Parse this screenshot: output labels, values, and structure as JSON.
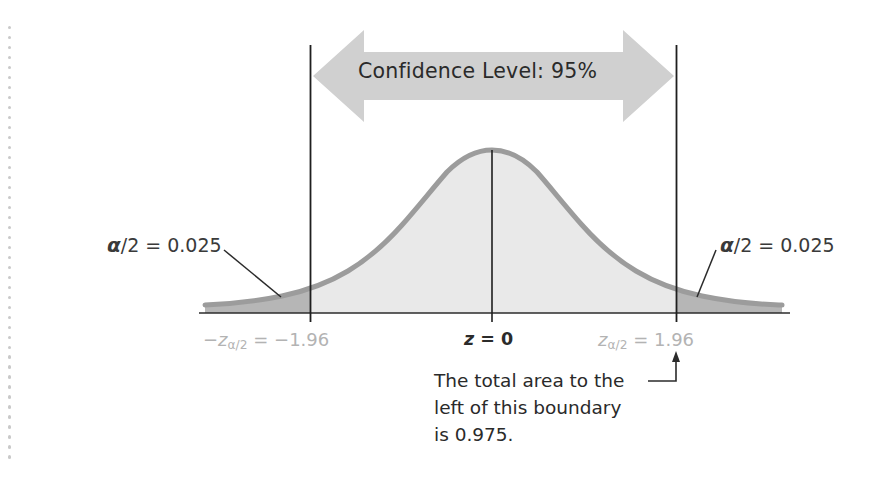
{
  "figure": {
    "background_color": "#ffffff"
  },
  "chart_data": {
    "type": "area",
    "xlabel": "z",
    "ylabel": "",
    "distribution": "standard normal",
    "x": [
      -4,
      -3.5,
      -3,
      -2.5,
      -1.96,
      -1.5,
      -1,
      -0.5,
      0,
      0.5,
      1,
      1.5,
      1.96,
      2.5,
      3,
      3.5,
      4
    ],
    "y": [
      0.0001,
      0.0009,
      0.0044,
      0.0175,
      0.0584,
      0.1295,
      0.242,
      0.3521,
      0.3989,
      0.3521,
      0.242,
      0.1295,
      0.0584,
      0.0175,
      0.0044,
      0.0009,
      0.0001
    ],
    "xlim": [
      -4,
      4
    ],
    "ylim": [
      0,
      0.42
    ],
    "grid": false,
    "legend": false,
    "boundaries": [
      {
        "name": "lower-critical-value",
        "z": -1.96,
        "label": "-zα/2 = -1.96"
      },
      {
        "name": "center",
        "z": 0,
        "label": "z = 0"
      },
      {
        "name": "upper-critical-value",
        "z": 1.96,
        "label": "zα/2 = 1.96"
      }
    ],
    "regions": [
      {
        "name": "left-tail",
        "area": 0.025,
        "label": "α/2 = 0.025",
        "shade": "dark"
      },
      {
        "name": "central-confidence-region",
        "area": 0.95,
        "label": "Confidence Level: 95%",
        "shade": "light"
      },
      {
        "name": "right-tail",
        "area": 0.025,
        "label": "α/2 = 0.025",
        "shade": "dark"
      }
    ],
    "annotations": [
      "The total area to the left of this boundary is 0.975."
    ]
  },
  "labels": {
    "confidence_level": "Confidence Level: 95%",
    "alpha_left": {
      "symbol": "α",
      "rest": "/2 = 0.025"
    },
    "alpha_right": {
      "symbol": "α",
      "rest": "/2 = 0.025"
    },
    "z_left": {
      "prefix": "−",
      "var": "z",
      "sub": "α/2",
      "value": " = −1.96"
    },
    "z_center": {
      "var": "z",
      "value": " = 0"
    },
    "z_right": {
      "var": "z",
      "sub": "α/2",
      "value": " = 1.96"
    },
    "note_line1": "The total area to the",
    "note_line2": "left of this boundary",
    "note_line3": "is 0.975."
  },
  "colors": {
    "curve_outline": "#9a9a9a",
    "central_fill": "#e8e8e8",
    "tail_fill": "#b4b4b4",
    "arrow_fill": "#cfcfcf",
    "axis_line": "#2b2b2b",
    "gray_text": "#b3b3b3",
    "dark_text": "#2a2a2a",
    "margin_dot": "#c9c9c9"
  }
}
